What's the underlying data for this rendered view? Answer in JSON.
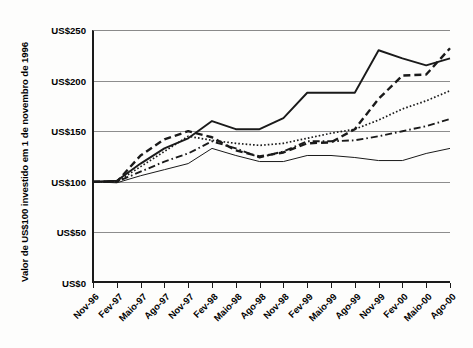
{
  "chart_data": {
    "type": "line",
    "title": "",
    "subtitle": "",
    "xlabel": "",
    "ylabel": "Valor de US$100 investido em 1 de novembro de 1996",
    "ylim": [
      0,
      250
    ],
    "ytick_values": [
      0,
      50,
      100,
      150,
      200,
      250
    ],
    "ytick_labels": [
      "US$0",
      "US$50",
      "US$100",
      "US$150",
      "US$200",
      "US$250"
    ],
    "grid": true,
    "grid_axis": "y",
    "legend": "none",
    "categories": [
      "Nov-96",
      "Fev-97",
      "Maio-97",
      "Ago-97",
      "Nov-97",
      "Fev-98",
      "Maio-98",
      "Ago-98",
      "Nov-98",
      "Fev-99",
      "Maio-99",
      "Ago-99",
      "Nov-99",
      "Fev-00",
      "Maio-00",
      "Ago-00"
    ],
    "series": [
      {
        "name": "serie-1",
        "style": "solid-thick",
        "color": "#1a1a1a",
        "values": [
          100,
          101,
          118,
          133,
          143,
          160,
          152,
          152,
          163,
          188,
          188,
          188,
          230,
          222,
          215,
          222
        ]
      },
      {
        "name": "serie-2",
        "style": "dashed",
        "color": "#1a1a1a",
        "values": [
          100,
          100,
          126,
          142,
          150,
          144,
          131,
          125,
          129,
          138,
          139,
          152,
          182,
          205,
          206,
          232
        ]
      },
      {
        "name": "serie-3",
        "style": "dotted",
        "color": "#1a1a1a",
        "values": [
          100,
          100,
          115,
          130,
          145,
          141,
          138,
          136,
          138,
          143,
          148,
          152,
          161,
          172,
          180,
          190
        ]
      },
      {
        "name": "serie-4",
        "style": "dash-dot",
        "color": "#1a1a1a",
        "values": [
          100,
          100,
          110,
          120,
          128,
          140,
          133,
          124,
          130,
          140,
          140,
          141,
          145,
          150,
          155,
          162
        ]
      },
      {
        "name": "serie-5",
        "style": "solid-thin",
        "color": "#1a1a1a",
        "values": [
          100,
          99,
          106,
          112,
          118,
          133,
          126,
          120,
          120,
          126,
          126,
          124,
          121,
          121,
          128,
          133
        ]
      }
    ]
  }
}
